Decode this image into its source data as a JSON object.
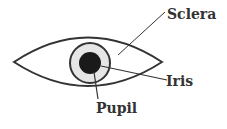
{
  "diagram": {
    "labels": {
      "sclera": "Sclera",
      "iris": "Iris",
      "pupil": "Pupil"
    },
    "colors": {
      "outline": "#333333",
      "iris_fill": "#e6e6e6",
      "pupil_fill": "#1a1a1a",
      "background": "#ffffff"
    }
  }
}
